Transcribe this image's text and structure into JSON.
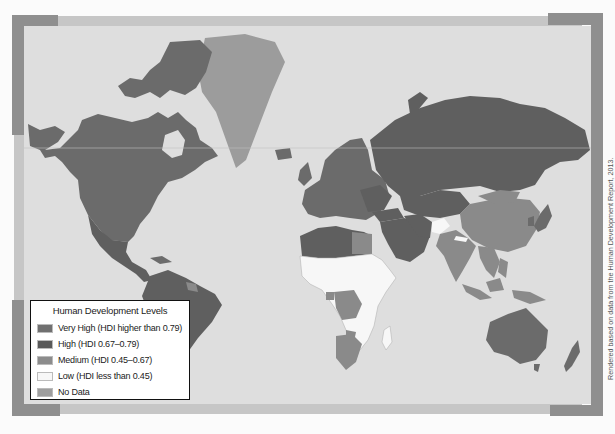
{
  "map": {
    "title": "Human Development Levels",
    "projection": "Mercator world map",
    "colors": {
      "ocean": "#dedede",
      "very_high": "#6b6b6b",
      "high": "#5f5f5f",
      "medium": "#8a8a8a",
      "low": "#f7f7f7",
      "no_data": "#9c9c9c",
      "frame_light": "#c6c6c6",
      "frame_dark": "#8f8f8f"
    }
  },
  "legend": {
    "title": "Human Development Levels",
    "items": [
      {
        "label": "Very High (HDI higher than 0.79)",
        "color": "#707070"
      },
      {
        "label": "High (HDI 0.67–0.79)",
        "color": "#595959"
      },
      {
        "label": "Medium (HDI 0.45–0.67)",
        "color": "#8c8c8c"
      },
      {
        "label": "Low (HDI less than 0.45)",
        "color": "#f7f7f7"
      },
      {
        "label": "No Data",
        "color": "#9e9e9e"
      }
    ]
  },
  "credit": "Rendered based on data from the Human Development Report, 2013."
}
